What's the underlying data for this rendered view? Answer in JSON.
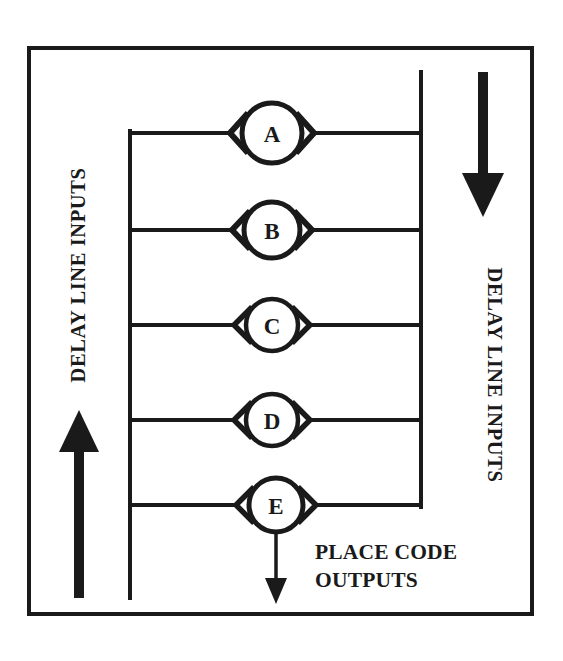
{
  "figure": {
    "background_color": "#ffffff",
    "ink_color": "#1a1a1a",
    "border": {
      "x": 27,
      "y": 46,
      "width": 507,
      "height": 570,
      "stroke_width": 4
    }
  },
  "labels": {
    "left_label": "DELAY LINE INPUTS",
    "right_label": "DELAY LINE INPUTS",
    "output_label_line1": "PLACE CODE",
    "output_label_line2": "OUTPUTS"
  },
  "buses": {
    "left_bus": {
      "x": 129,
      "y_top": 133,
      "y_bottom": 598
    },
    "right_bus": {
      "x": 421,
      "y_top": 72,
      "y_bottom": 505
    }
  },
  "nodes": [
    {
      "id": "A",
      "label": "A",
      "cx": 272,
      "cy": 133,
      "r": 30,
      "row_y": 133
    },
    {
      "id": "B",
      "label": "B",
      "cx": 272,
      "cy": 230,
      "r": 28,
      "row_y": 230
    },
    {
      "id": "C",
      "label": "C",
      "cx": 272,
      "cy": 325,
      "r": 26,
      "row_y": 325
    },
    {
      "id": "D",
      "label": "D",
      "cx": 272,
      "cy": 420,
      "r": 26,
      "row_y": 420
    },
    {
      "id": "E",
      "label": "E",
      "cx": 276,
      "cy": 505,
      "r": 27,
      "row_y": 505
    }
  ],
  "arrows": {
    "left_arrow": {
      "x": 79,
      "y_tail": 598,
      "y_head": 412,
      "direction": "up"
    },
    "right_arrow": {
      "x": 483,
      "y_tail": 72,
      "y_head": 215,
      "direction": "down"
    },
    "output_arrow": {
      "x": 276,
      "y_tail": 532,
      "y_head": 602,
      "direction": "down"
    }
  }
}
